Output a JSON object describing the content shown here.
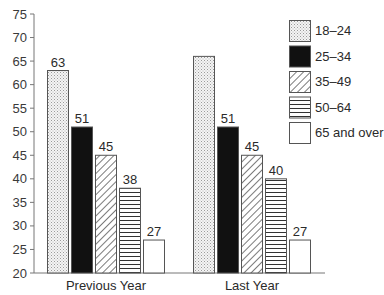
{
  "chart_data": {
    "type": "bar",
    "title": "",
    "xlabel": "",
    "ylabel": "",
    "ylim": [
      20,
      75
    ],
    "yticks": [
      20,
      25,
      30,
      35,
      40,
      45,
      50,
      55,
      60,
      65,
      70,
      75
    ],
    "grid": false,
    "legend_position": "top-right",
    "categories": [
      "Previous Year",
      "Last Year"
    ],
    "series": [
      {
        "name": "18–24",
        "pattern": "dots",
        "values": [
          63,
          66
        ],
        "labels": [
          "63",
          ""
        ]
      },
      {
        "name": "25–34",
        "pattern": "solid-black",
        "values": [
          51,
          51
        ],
        "labels": [
          "51",
          "51"
        ]
      },
      {
        "name": "35–49",
        "pattern": "diagonal-hatch",
        "values": [
          45,
          45
        ],
        "labels": [
          "45",
          "45"
        ]
      },
      {
        "name": "50–64",
        "pattern": "horizontal-lines",
        "values": [
          38,
          40
        ],
        "labels": [
          "38",
          "40"
        ]
      },
      {
        "name": "65 and over",
        "pattern": "white",
        "values": [
          27,
          27
        ],
        "labels": [
          "27",
          "27"
        ]
      }
    ]
  },
  "legend": {
    "items": [
      "18–24",
      "25–34",
      "35–49",
      "50–64",
      "65 and over"
    ]
  }
}
